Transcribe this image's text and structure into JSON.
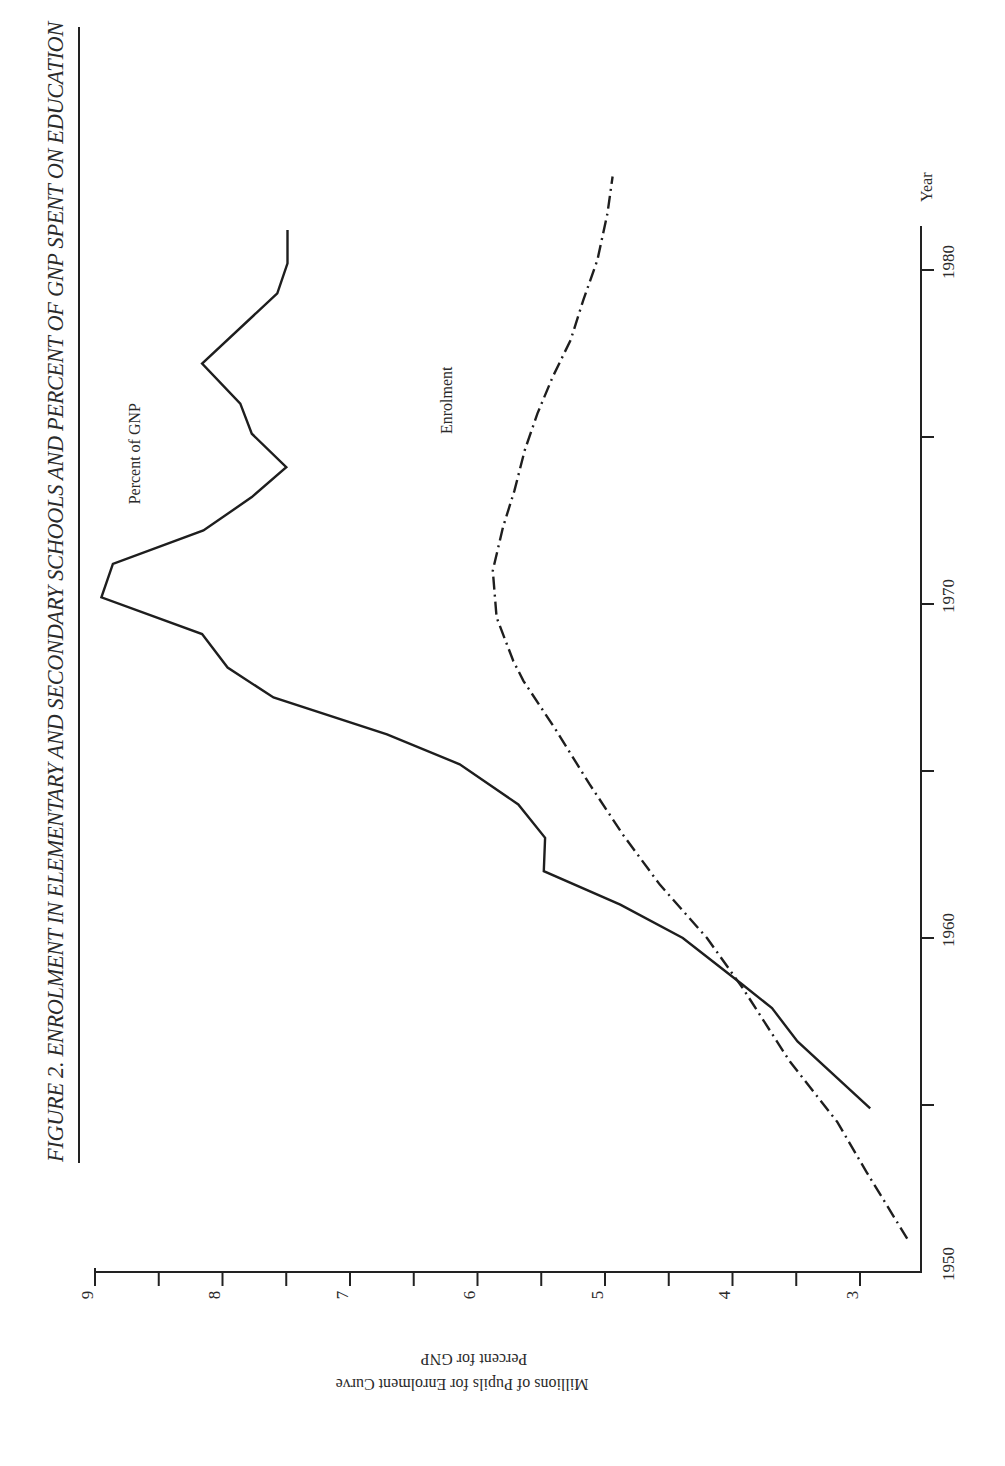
{
  "figure": {
    "title": "FIGURE 2. ENROLMENT IN ELEMENTARY AND SECONDARY SCHOOLS AND  PERCENT OF GNP SPENT ON EDUCATION",
    "orientation": "page rotated 90° counter-clockwise"
  },
  "chart_data": {
    "type": "line",
    "title": "FIGURE 2. ENROLMENT IN ELEMENTARY AND SECONDARY SCHOOLS AND PERCENT OF GNP SPENT ON EDUCATION",
    "xlabel": "Year",
    "ylabel": [
      "Millions of Pupils for Enrolment Curve",
      "Percent for GNP"
    ],
    "xlim": [
      1950,
      1981
    ],
    "ylim": [
      2.6,
      9
    ],
    "x_ticks": [
      1950,
      1955,
      1960,
      1965,
      1970,
      1975,
      1980
    ],
    "x_tick_labels": [
      "1950",
      "",
      "1960",
      "",
      "1970",
      "",
      "1980"
    ],
    "y_ticks": [
      3,
      3.5,
      4,
      4.5,
      5,
      5.5,
      6,
      6.5,
      7,
      7.5,
      8,
      8.5,
      9
    ],
    "y_tick_labels": [
      "3",
      "",
      "4",
      "",
      "5",
      "",
      "6",
      "",
      "7",
      "",
      "8",
      "",
      "9"
    ],
    "grid": false,
    "legend": "inline labels",
    "series": [
      {
        "name": "Percent of GNP",
        "style": "solid",
        "label_position": {
          "year": 1974.5,
          "value": 8.65
        },
        "x": [
          1954.9,
          1956.9,
          1957.9,
          1958.6,
          1960.0,
          1961.0,
          1962.0,
          1963.0,
          1964.0,
          1965.2,
          1966.1,
          1967.2,
          1968.1,
          1969.1,
          1970.2,
          1971.2,
          1972.2,
          1973.2,
          1974.1,
          1975.1,
          1976.0,
          1977.2,
          1979.3,
          1980.2,
          1981.2
        ],
        "values": [
          2.92,
          3.49,
          3.69,
          3.92,
          4.39,
          4.88,
          5.48,
          5.47,
          5.68,
          6.14,
          6.71,
          7.6,
          7.96,
          8.16,
          8.95,
          8.86,
          8.15,
          7.77,
          7.5,
          7.77,
          7.86,
          8.16,
          7.57,
          7.49,
          7.49
        ]
      },
      {
        "name": "Enrolment",
        "style": "dash-dot",
        "label_position": {
          "year": 1976.1,
          "value": 6.2
        },
        "x": [
          1951.0,
          1953.0,
          1954.5,
          1956.3,
          1958.5,
          1960.0,
          1961.6,
          1963.1,
          1964.6,
          1966.2,
          1967.7,
          1968.3,
          1969.6,
          1971.0,
          1972.3,
          1973.4,
          1974.6,
          1975.7,
          1976.8,
          1977.9,
          1979.1,
          1980.3,
          1981.7,
          1982.8
        ],
        "values": [
          2.63,
          2.95,
          3.18,
          3.55,
          3.92,
          4.2,
          4.57,
          4.86,
          5.12,
          5.38,
          5.64,
          5.72,
          5.85,
          5.88,
          5.8,
          5.71,
          5.63,
          5.53,
          5.41,
          5.27,
          5.17,
          5.06,
          4.98,
          4.94
        ]
      }
    ]
  },
  "labels": {
    "x_axis_title": "Year",
    "y_axis_title_line1": "Millions of Pupils for Enrolment Curve",
    "y_axis_title_line2": "Percent for GNP",
    "series_gnp": "Percent of GNP",
    "series_enrolment": "Enrolment"
  }
}
